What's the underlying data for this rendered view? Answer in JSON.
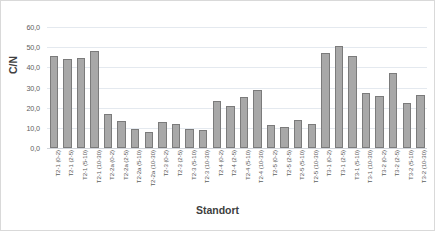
{
  "chart_data": {
    "type": "bar",
    "title": "",
    "xlabel": "Standort",
    "ylabel": "C/N",
    "ylim": [
      0,
      60
    ],
    "ytick_step": 10,
    "ytick_labels": [
      "0,0",
      "10,0",
      "20,0",
      "30,0",
      "40,0",
      "50,0",
      "60,0"
    ],
    "grid": true,
    "legend": false,
    "bar_color": "#a8a8a8",
    "bar_border_color": "#7b7b7b",
    "gridline_color": "#e4e9ef",
    "categories": [
      "T2-1 (0-2)",
      "T2-1 (2-5)",
      "T2-1 (5-10)",
      "T2-1 (10-30)",
      "T2-2a (0-2)",
      "T2-2a (2-5)",
      "T2-2a (5-10)",
      "T2-2a (10-30)",
      "T2-3 (0-2)",
      "T2-3 (2-5)",
      "T2-3 (5-10)",
      "T2-3 (10-30)",
      "T2-4 (0-2)",
      "T2-4 (2-5)",
      "T2-4 (5-10)",
      "T2-4 (10-30)",
      "T2-5 (0-2)",
      "T2-5 (2-5)",
      "T2-5 (5-10)",
      "T2-5 (10-30)",
      "T3-1 (0-2)",
      "T3-1 (2-5)",
      "T3-1 (5-10)",
      "T3-1 (10-30)",
      "T3-2 (0-2)",
      "T3-2 (2-5)",
      "T3-2 (5-10)",
      "T3-2 (10-30)"
    ],
    "values": [
      45.5,
      44.3,
      44.6,
      48.0,
      16.7,
      13.2,
      9.6,
      7.8,
      12.8,
      11.9,
      9.6,
      8.7,
      23.3,
      21.0,
      25.2,
      28.8,
      11.3,
      10.2,
      13.7,
      12.0,
      47.2,
      50.7,
      45.7,
      27.5,
      26.0,
      37.2,
      22.2,
      26.2
    ]
  }
}
